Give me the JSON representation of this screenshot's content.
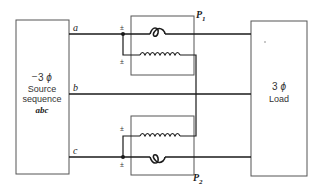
{
  "diagram": {
    "source": {
      "line1": "3",
      "phi": "ϕ",
      "line2": "Source",
      "line3": "sequence",
      "line4": "abc",
      "marker": "–"
    },
    "load": {
      "line1": "3",
      "phi": "ϕ",
      "line2": "Load"
    },
    "lines": {
      "a": "a",
      "b": "b",
      "c": "c"
    },
    "wattmeters": {
      "p1": {
        "letter": "P",
        "subscript": "1"
      },
      "p2": {
        "letter": "P",
        "subscript": "2"
      }
    },
    "polarity_mark": "±",
    "colors": {
      "line": "#1a1a1a",
      "box": "#555555",
      "background": "#ffffff"
    }
  }
}
